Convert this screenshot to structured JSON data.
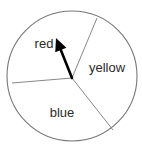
{
  "figure": {
    "name": "spinner-wheel",
    "background_color": "#ffffff",
    "outline_color": "#777777",
    "divider_color": "#888888",
    "arrow_color": "#000000",
    "label_color": "#2b2b2b"
  },
  "circle": {
    "center_x": 72,
    "center_y": 76,
    "radius": 65
  },
  "pivot": {
    "x": 72,
    "y": 78
  },
  "arrow": {
    "name": "spinner-arrow",
    "tail_x": 72,
    "tail_y": 78,
    "tip_x": 56,
    "tip_y": 38,
    "points_to": "red"
  },
  "dividers": [
    {
      "name": "divider-red-yellow",
      "end_x": 97,
      "end_y": 18
    },
    {
      "name": "divider-red-unlabeled",
      "end_x": 12,
      "end_y": 83
    },
    {
      "name": "divider-blue-yellow",
      "end_x": 113,
      "end_y": 130
    }
  ],
  "sectors": [
    {
      "name": "red",
      "label": "red",
      "label_x": 44,
      "label_y": 48
    },
    {
      "name": "yellow",
      "label": "yellow",
      "label_x": 107,
      "label_y": 72
    },
    {
      "name": "blue",
      "label": "blue",
      "label_x": 62,
      "label_y": 117
    },
    {
      "name": "unlabeled",
      "label": "",
      "label_x": 30,
      "label_y": 100
    }
  ],
  "chart_data": {
    "type": "pie",
    "title": "",
    "categories": [
      "red",
      "yellow",
      "blue",
      "unlabeled"
    ],
    "values": [
      25,
      31,
      31,
      13
    ],
    "labels_shown": [
      "red",
      "yellow",
      "blue"
    ],
    "legend": "none",
    "grid": false
  }
}
